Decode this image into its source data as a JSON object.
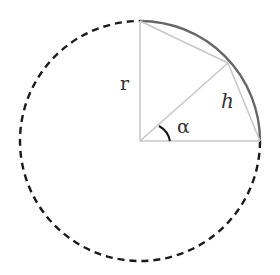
{
  "diagram": {
    "type": "circle-geometry",
    "center": {
      "x": 140,
      "y": 141
    },
    "radius": 120,
    "labels": {
      "radius": "r",
      "chord": "h",
      "angle": "α"
    },
    "colors": {
      "circle": "#1a1a1a",
      "arc": "#666666",
      "construction_lines": "#c8c8c8",
      "angle_mark": "#1a1a1a",
      "text": "#333333",
      "background": "#ffffff"
    },
    "points": {
      "top": {
        "x": 140,
        "y": 21
      },
      "right": {
        "x": 260,
        "y": 141
      },
      "on_arc": {
        "x": 228,
        "y": 63
      }
    }
  }
}
